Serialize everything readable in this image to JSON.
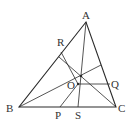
{
  "diagram": {
    "stroke_color": "#2a2a2a",
    "points": {
      "A": {
        "label": "A",
        "x": 86,
        "y": 22
      },
      "B": {
        "label": "B",
        "x": 19,
        "y": 107
      },
      "C": {
        "label": "C",
        "x": 116,
        "y": 107
      },
      "R": {
        "label": "R",
        "x": 61,
        "y": 53
      },
      "O": {
        "label": "O",
        "x": 78,
        "y": 84
      },
      "Q": {
        "label": "Q",
        "x": 110,
        "y": 84
      },
      "P": {
        "label": "P",
        "x": 60,
        "y": 107
      },
      "S": {
        "label": "S",
        "x": 78,
        "y": 107
      },
      "G": {
        "x": 81,
        "y": 76
      }
    },
    "labels": {
      "A": "A",
      "B": "B",
      "C": "C",
      "R": "R",
      "O": "O",
      "Q": "Q",
      "P": "P",
      "S": "S"
    }
  }
}
